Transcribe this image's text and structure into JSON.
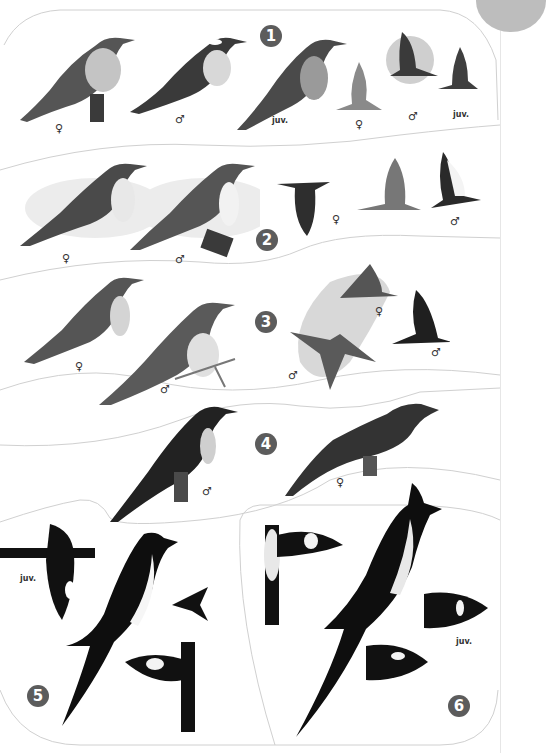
{
  "plate": {
    "colors": {
      "badge": "#5c5c5c",
      "frame_line": "#d0d0d0",
      "corner_tab": "#bdbdbd",
      "bird_dark": "#1a1a1a",
      "bird_mid": "#6a6a6a",
      "wash": "#d8d8d8"
    },
    "sections": [
      {
        "number": "1",
        "labels": [
          "♀",
          "♂",
          "juv.",
          "♀",
          "♂",
          "juv."
        ]
      },
      {
        "number": "2",
        "labels": [
          "♀",
          "♂",
          "♀",
          "♂"
        ]
      },
      {
        "number": "3",
        "labels": [
          "♀",
          "♂",
          "♀",
          "♂",
          "♂"
        ]
      },
      {
        "number": "4",
        "labels": [
          "♂",
          "♀"
        ]
      },
      {
        "number": "5",
        "labels": [
          "juv."
        ]
      },
      {
        "number": "6",
        "labels": [
          "juv."
        ]
      }
    ]
  }
}
